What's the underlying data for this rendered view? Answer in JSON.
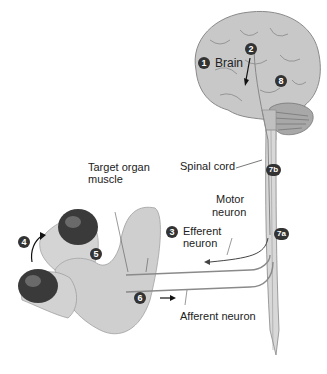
{
  "figure": {
    "labels": {
      "brain": "Brain",
      "spinal_cord": "Spinal cord",
      "target_organ_line1": "Target organ",
      "target_organ_line2": "muscle",
      "motor_neuron_line1": "Motor",
      "motor_neuron_line2": "neuron",
      "efferent_line1": "Efferent",
      "efferent_line2": "neuron",
      "afferent": "Afferent neuron"
    },
    "steps": {
      "s1": "1",
      "s2": "2",
      "s3": "3",
      "s4": "4",
      "s5": "5",
      "s6": "6",
      "s7a": "7a",
      "s7b": "7b",
      "s8": "8"
    },
    "colors": {
      "brain_fill": "#c8c8c8",
      "brain_stroke": "#8a8a8a",
      "skin": "#cfcfcf",
      "dumbbell": "#3a3a3a",
      "nerve": "#9a9a9a",
      "badge": "#333333"
    }
  }
}
